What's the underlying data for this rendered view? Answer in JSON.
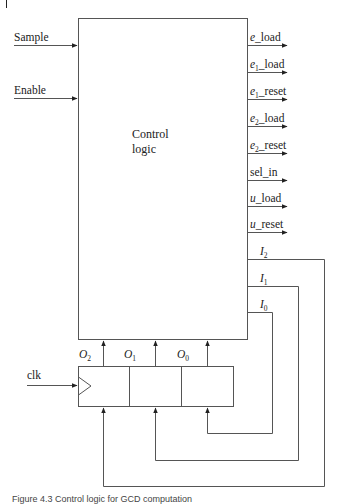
{
  "diagram": {
    "title": "Control logic",
    "control_block": {
      "line1": "Control",
      "line2": "logic"
    },
    "inputs": [
      {
        "label": "Sample"
      },
      {
        "label": "Enable"
      }
    ],
    "outputs": [
      {
        "base": "e",
        "sub": "",
        "suffix": "_load"
      },
      {
        "base": "e",
        "sub": "1",
        "suffix": "_load"
      },
      {
        "base": "e",
        "sub": "1",
        "suffix": "_reset"
      },
      {
        "base": "e",
        "sub": "2",
        "suffix": "_load"
      },
      {
        "base": "e",
        "sub": "2",
        "suffix": "_reset"
      },
      {
        "base": "",
        "sub": "",
        "suffix": "sel_in"
      },
      {
        "base": "u",
        "sub": "",
        "suffix": "_load"
      },
      {
        "base": "u",
        "sub": "",
        "suffix": "_reset"
      }
    ],
    "next_state": [
      {
        "base": "I",
        "sub": "2"
      },
      {
        "base": "I",
        "sub": "1"
      },
      {
        "base": "I",
        "sub": "0"
      }
    ],
    "state_register": {
      "clock_label": "clk",
      "bits": [
        {
          "base": "O",
          "sub": "2"
        },
        {
          "base": "O",
          "sub": "1"
        },
        {
          "base": "O",
          "sub": "0"
        }
      ]
    },
    "caption": "Figure 4.3   Control logic for GCD computation"
  }
}
